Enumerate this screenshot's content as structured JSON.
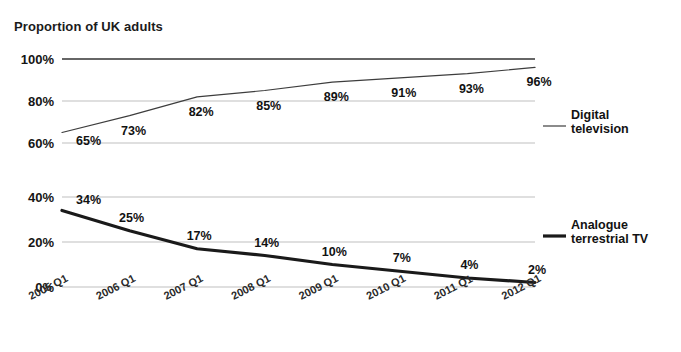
{
  "axis_title": "Proportion of UK adults",
  "chart_data": {
    "type": "line",
    "title": "",
    "xlabel": "",
    "ylabel": "Proportion of UK adults",
    "grid": true,
    "legend_position": "right",
    "categories": [
      "2005 Q1",
      "2006 Q1",
      "2007 Q1",
      "2008 Q1",
      "2009 Q1",
      "2010 Q1",
      "2011 Q1",
      "2012 Q1"
    ],
    "panels": [
      {
        "name": "upper",
        "ylim": [
          40,
          100
        ],
        "yticks": [
          100,
          80,
          60,
          40
        ],
        "ytick_labels": [
          "100%",
          "80%",
          "60%",
          "40%"
        ],
        "reference_line": {
          "value": 100,
          "label": "100%"
        }
      },
      {
        "name": "lower",
        "ylim": [
          0,
          40
        ],
        "yticks": [
          40,
          20,
          0
        ],
        "ytick_labels": [
          "40%",
          "20%",
          "0%"
        ]
      }
    ],
    "series": [
      {
        "name": "Digital television",
        "legend_label_line1": "Digital",
        "legend_label_line2": "television",
        "panel": "upper",
        "color": "#3d3d3d",
        "line_width": 1.2,
        "values": [
          65,
          73,
          82,
          85,
          89,
          91,
          93,
          96
        ],
        "value_labels": [
          "65%",
          "73%",
          "82%",
          "85%",
          "89%",
          "91%",
          "93%",
          "96%"
        ]
      },
      {
        "name": "Analogue terrestrial TV",
        "legend_label_line1": "Analogue",
        "legend_label_line2": "terrestrial TV",
        "panel": "lower",
        "color": "#1a1a1a",
        "line_width": 3.2,
        "values": [
          34,
          25,
          17,
          14,
          10,
          7,
          4,
          2
        ],
        "value_labels": [
          "34%",
          "25%",
          "17%",
          "14%",
          "10%",
          "7%",
          "4%",
          "2%"
        ]
      }
    ]
  },
  "colors": {
    "gridline": "#b8b8b8",
    "reference_line": "#333333",
    "text": "#151515",
    "background": "#ffffff"
  }
}
